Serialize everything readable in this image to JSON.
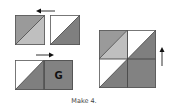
{
  "caption": "Make 4.",
  "colors": {
    "medium_gray": "#9a9a9a",
    "light_gray": "#bfbfbf",
    "dark_gray": "#7f7f7f",
    "white": "#ffffff",
    "outline": "#555555",
    "letter": "#111111"
  },
  "step1": {
    "units": [
      {
        "type": "half-square-triangle",
        "upper_left": "medium_gray",
        "lower_right": "light_gray"
      },
      {
        "type": "half-square-triangle",
        "upper_left": "white",
        "lower_right": "dark_gray"
      }
    ],
    "arrow": "left"
  },
  "step2": {
    "units": [
      {
        "type": "half-square-triangle",
        "upper_left": "white",
        "lower_right": "dark_gray"
      },
      {
        "type": "square",
        "fill": "dark_gray",
        "label": "G"
      }
    ],
    "arrow": "right"
  },
  "result_block": {
    "grid": "2x2",
    "cells": [
      {
        "upper_left": "medium_gray",
        "lower_right": "light_gray"
      },
      {
        "upper_left": "white",
        "lower_right": "dark_gray"
      },
      {
        "upper_left": "white",
        "lower_right": "dark_gray"
      },
      {
        "fill": "dark_gray"
      }
    ],
    "arrow": "up"
  }
}
